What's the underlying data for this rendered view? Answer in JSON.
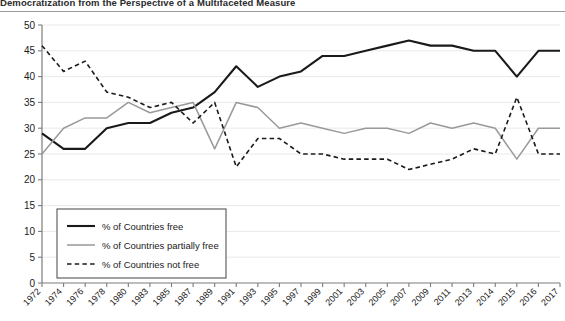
{
  "title": "Democratization from the Perspective of a Multifaceted Measure",
  "chart_data": {
    "type": "line",
    "title": "Democratization from the Perspective of a Multifaceted Measure",
    "xlabel": "",
    "ylabel": "",
    "ylim": [
      0,
      50
    ],
    "ytick_step": 5,
    "yticks": [
      "0",
      "5",
      "10",
      "15",
      "20",
      "25",
      "30",
      "35",
      "40",
      "45",
      "50"
    ],
    "grid": true,
    "legend_position": "inside-lower-left",
    "categories": [
      "1972",
      "1974",
      "1976",
      "1978",
      "1980",
      "1983",
      "1985",
      "1987",
      "1989",
      "1991",
      "1993",
      "1995",
      "1997",
      "1999",
      "2001",
      "2003",
      "2005",
      "2007",
      "2009",
      "2011",
      "2013",
      "2014",
      "2015",
      "2016",
      "2017"
    ],
    "series": [
      {
        "name": "% of Countries free",
        "color": "#1a1a1a",
        "style": "solid",
        "width": 2.1,
        "values": [
          29,
          26,
          26,
          30,
          31,
          31,
          33,
          34,
          37,
          42,
          38,
          40,
          41,
          44,
          44,
          45,
          46,
          47,
          46,
          46,
          45,
          45,
          40,
          45,
          45
        ]
      },
      {
        "name": "% of Countries partially free",
        "color": "#999999",
        "style": "solid",
        "width": 1.5,
        "values": [
          25,
          30,
          32,
          32,
          35,
          33,
          34,
          35,
          26,
          35,
          34,
          30,
          31,
          30,
          29,
          30,
          30,
          29,
          31,
          30,
          31,
          30,
          24,
          30,
          30
        ]
      },
      {
        "name": "% of Countries not free",
        "color": "#1a1a1a",
        "style": "dashed",
        "width": 1.6,
        "values": [
          46,
          41,
          43,
          37,
          36,
          34,
          35,
          31,
          35,
          22.5,
          28,
          28,
          25,
          25,
          24,
          24,
          24,
          22,
          23,
          24,
          26,
          25,
          36,
          25,
          25
        ]
      }
    ]
  },
  "legend": {
    "items": [
      {
        "label": "% of Countries free"
      },
      {
        "label": "% of Countries partially free"
      },
      {
        "label": "% of Countries not free"
      }
    ]
  }
}
